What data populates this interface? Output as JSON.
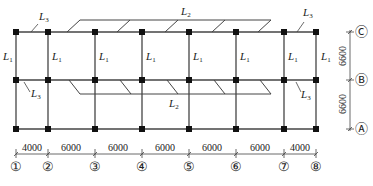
{
  "diagram": {
    "type": "structural-floor-plan",
    "grid_axes_x": [
      "①",
      "②",
      "③",
      "④",
      "⑤",
      "⑥",
      "⑦",
      "⑧"
    ],
    "grid_axes_y": [
      "Ⓐ",
      "Ⓑ",
      "Ⓒ"
    ],
    "spans_x": [
      "4000",
      "6000",
      "6000",
      "6000",
      "6000",
      "6000",
      "4000"
    ],
    "spans_y": [
      "6600",
      "6600"
    ],
    "member_labels": {
      "L1": {
        "main": "L",
        "sub": "1"
      },
      "L2": {
        "main": "L",
        "sub": "2"
      },
      "L3": {
        "main": "L",
        "sub": "3"
      }
    },
    "colors": {
      "line": "#333333",
      "column": "#111111",
      "text": "#222222"
    }
  }
}
